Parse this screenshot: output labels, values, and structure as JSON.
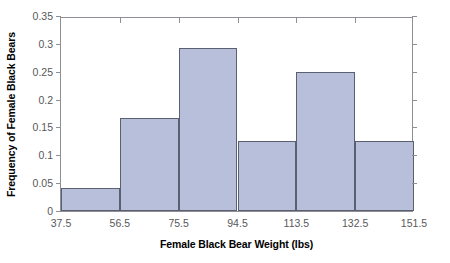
{
  "chart_data": {
    "type": "bar",
    "title": "",
    "xlabel": "Female Black Bear Weight (lbs)",
    "ylabel": "Frequency of Female Black Bears",
    "categories": [
      "37.5-56.5",
      "56.5-75.5",
      "75.5-94.5",
      "94.5-113.5",
      "113.5-132.5",
      "132.5-151.5"
    ],
    "bin_edges": [
      37.5,
      56.5,
      75.5,
      94.5,
      113.5,
      132.5,
      151.5
    ],
    "values": [
      0.042,
      0.167,
      0.292,
      0.125,
      0.25,
      0.125
    ],
    "xlim": [
      37.5,
      151.5
    ],
    "ylim": [
      0,
      0.35
    ],
    "xticks": [
      "37.5",
      "56.5",
      "75.5",
      "94.5",
      "113.5",
      "132.5",
      "151.5"
    ],
    "yticks": [
      "0",
      "0.05",
      "0.1",
      "0.15",
      "0.2",
      "0.25",
      "0.3",
      "0.35"
    ],
    "ytick_values": [
      0,
      0.05,
      0.1,
      0.15,
      0.2,
      0.25,
      0.3,
      0.35
    ],
    "grid": false,
    "legend": null,
    "bar_fill_color": "#b7bfdb",
    "bar_border_color": "#5a6070",
    "axis_color": "#8d8f94",
    "tick_label_color": "#58585a",
    "axis_title_color": "#000000"
  }
}
